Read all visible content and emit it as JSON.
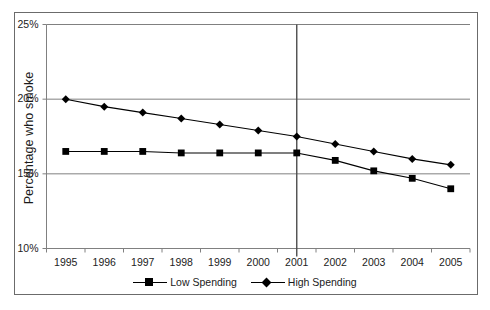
{
  "axis": {
    "y_label": "Percentage who smoke",
    "y_ticks": [
      "25%",
      "20%",
      "15%",
      "10%"
    ],
    "x_ticks": [
      "1995",
      "1996",
      "1997",
      "1998",
      "1999",
      "2000",
      "2001",
      "2002",
      "2003",
      "2004",
      "2005"
    ]
  },
  "legend": {
    "items": [
      {
        "label": "Low Spending",
        "marker": "square-marker-icon",
        "color": "#000000"
      },
      {
        "label": "High Spending",
        "marker": "diamond-marker-icon",
        "color": "#000000"
      }
    ]
  },
  "annotations": {
    "vertical_marker_year": "2001"
  },
  "colors": {
    "gridline": "#808080",
    "axis": "#808080",
    "series": "#000000",
    "frame": "#6b6b6b",
    "marker_vline": "#4d4d4d"
  },
  "chart_data": {
    "type": "line",
    "title": "",
    "xlabel": "",
    "ylabel": "Percentage who smoke",
    "x": [
      1995,
      1996,
      1997,
      1998,
      1999,
      2000,
      2001,
      2002,
      2003,
      2004,
      2005
    ],
    "categories": [
      "1995",
      "1996",
      "1997",
      "1998",
      "1999",
      "2000",
      "2001",
      "2002",
      "2003",
      "2004",
      "2005"
    ],
    "series": [
      {
        "name": "Low Spending",
        "marker": "square",
        "values": [
          16.5,
          16.5,
          16.5,
          16.4,
          16.4,
          16.4,
          16.4,
          15.9,
          15.2,
          14.7,
          14.0
        ]
      },
      {
        "name": "High Spending",
        "marker": "diamond",
        "values": [
          20.0,
          19.5,
          19.1,
          18.7,
          18.3,
          17.9,
          17.5,
          17.0,
          16.5,
          16.0,
          15.6
        ]
      }
    ],
    "ylim": [
      10,
      25
    ],
    "y_ticks": [
      10,
      15,
      20,
      25
    ],
    "y_tick_labels": [
      "10%",
      "15%",
      "20%",
      "25%"
    ],
    "grid": true,
    "grid_axis": "y",
    "legend_position": "bottom",
    "vertical_reference_line": 2001
  }
}
